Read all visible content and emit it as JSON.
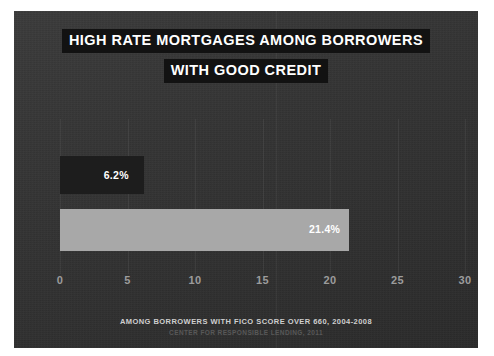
{
  "chart_data": {
    "type": "bar",
    "orientation": "horizontal",
    "title": "HIGH RATE MORTGAGES AMONG BORROWERS WITH GOOD CREDIT",
    "title_lines": [
      "HIGH RATE MORTGAGES AMONG BORROWERS",
      "WITH GOOD CREDIT"
    ],
    "categories": [
      "Bar 1",
      "Bar 2"
    ],
    "values": [
      6.2,
      21.4
    ],
    "data_labels": [
      "6.2%",
      "21.4%"
    ],
    "bar_colors": [
      "#1d1d1d",
      "#a8a8a8"
    ],
    "xlabel": "",
    "ylabel": "",
    "xlim": [
      0,
      32
    ],
    "xticks": [
      0,
      5,
      10,
      15,
      20,
      25,
      30
    ],
    "xtick_labels": [
      "0",
      "5",
      "10",
      "15",
      "20",
      "25",
      "30"
    ],
    "grid": true,
    "legend": false,
    "footnote": "AMONG BORROWERS WITH FICO SCORE OVER 660, 2004-2008",
    "source": "CENTER FOR RESPONSIBLE LENDING, 2011",
    "background_color": "#343434",
    "text_color": "#ffffff",
    "tick_color": "#9c9c9c"
  }
}
